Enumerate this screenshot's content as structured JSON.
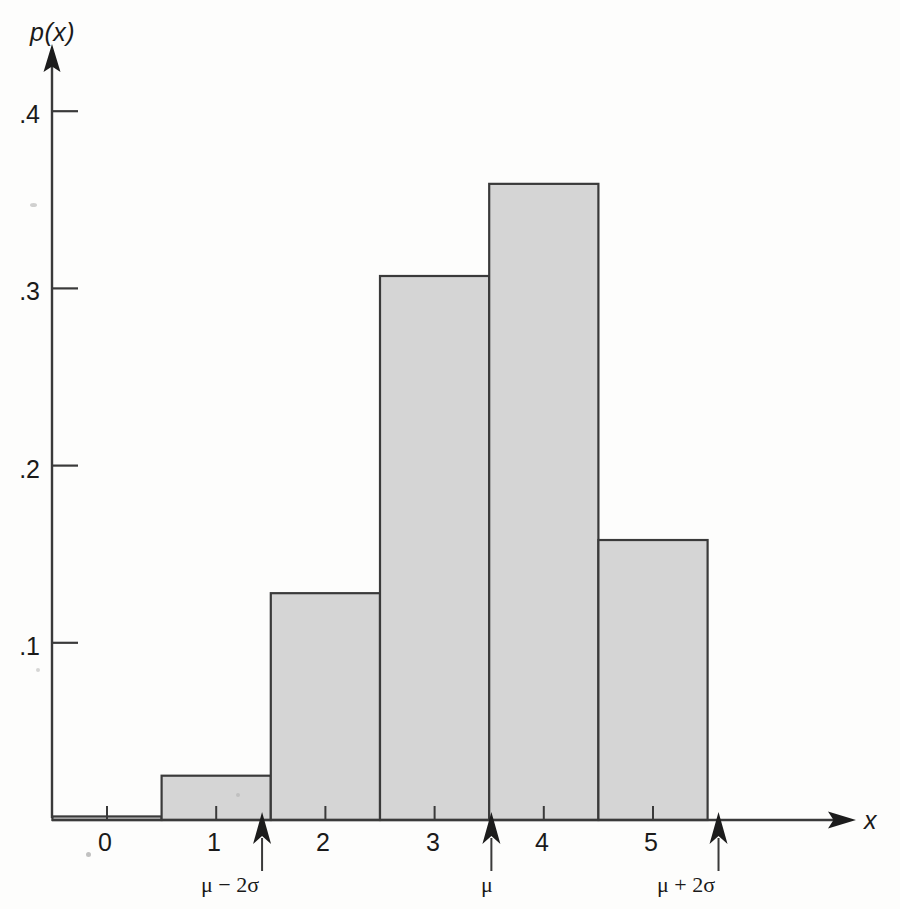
{
  "chart_data": {
    "type": "bar",
    "title": "",
    "subtitle": "",
    "xlabel": "x",
    "ylabel": "p(x)",
    "categories": [
      "0",
      "1",
      "2",
      "3",
      "4",
      "5"
    ],
    "x": [
      0,
      1,
      2,
      3,
      4,
      5
    ],
    "values": [
      0.002,
      0.025,
      0.128,
      0.307,
      0.359,
      0.158
    ],
    "bar_width": 1.0,
    "xlim": [
      -0.5,
      5.5
    ],
    "ylim": [
      0,
      0.44
    ],
    "xticks": [
      0,
      1,
      2,
      3,
      4,
      5
    ],
    "xtick_labels": [
      "0",
      "1",
      "2",
      "3",
      "4",
      "5"
    ],
    "yticks": [
      0.1,
      0.2,
      0.3,
      0.4
    ],
    "ytick_labels": [
      ".1",
      ".2",
      ".3",
      ".4"
    ],
    "grid": false,
    "legend": null,
    "legend_position": "none",
    "bar_fill_color": "#d5d5d5",
    "bar_edge_color": "#3a3a3a",
    "axis_color": "#3a3a3a",
    "annotations": [
      {
        "label": "μ − 2σ",
        "x": 1.42,
        "marker": "up-arrow"
      },
      {
        "label": "μ",
        "x": 3.52,
        "marker": "up-arrow"
      },
      {
        "label": "μ + 2σ",
        "x": 5.6,
        "marker": "up-arrow"
      }
    ]
  },
  "axes": {
    "y_axis_label": "p(x)",
    "x_axis_label": "x"
  },
  "y_ticks": [
    {
      "label": ".4",
      "value": 0.4
    },
    {
      "label": ".3",
      "value": 0.3
    },
    {
      "label": ".2",
      "value": 0.2
    },
    {
      "label": ".1",
      "value": 0.1
    }
  ],
  "x_ticks": [
    {
      "label": "0",
      "value": 0
    },
    {
      "label": "1",
      "value": 1
    },
    {
      "label": "2",
      "value": 2
    },
    {
      "label": "3",
      "value": 3
    },
    {
      "label": "4",
      "value": 4
    },
    {
      "label": "5",
      "value": 5
    }
  ],
  "annotations": [
    {
      "label": "μ − 2σ"
    },
    {
      "label": "μ"
    },
    {
      "label": "μ + 2σ"
    }
  ]
}
